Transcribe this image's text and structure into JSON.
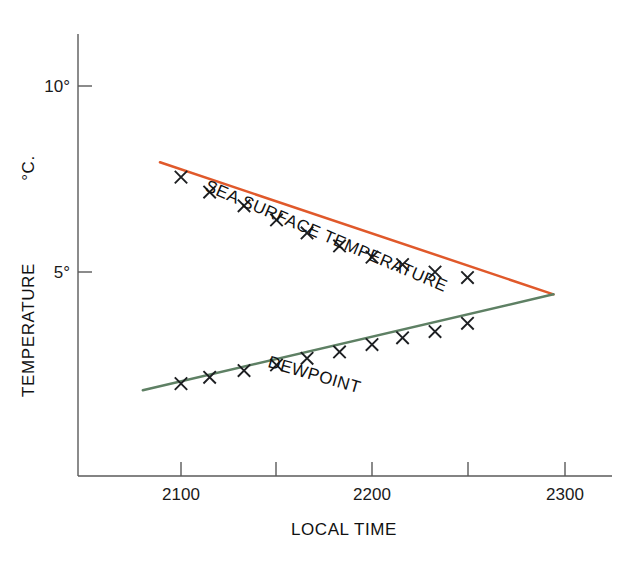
{
  "chart_data": {
    "type": "line",
    "title": "",
    "xlabel": "LOCAL TIME",
    "ylabel": "TEMPERATURE  °C.",
    "xlim": [
      2080,
      2312
    ],
    "ylim": [
      1.2,
      11.5
    ],
    "grid": false,
    "legend_position": "inline-annotation",
    "x_major_ticks": [
      2100,
      2200,
      2300
    ],
    "x_major_tick_labels": [
      "2100",
      "2200",
      "2300"
    ],
    "x_minor_ticks": [
      2150,
      2250
    ],
    "y_ticks": [
      5,
      10
    ],
    "y_tick_labels": [
      "5°",
      "10°"
    ],
    "units": "degrees Celsius",
    "annotations": [
      {
        "text": "SEA SURFACE TEMPERATURE",
        "rotation": 23,
        "x": 2112,
        "y": 7.2
      },
      {
        "text": "DEWPOINT",
        "rotation": 16,
        "x": 2145,
        "y": 2.45
      }
    ],
    "series": [
      {
        "name": "SEA SURFACE TEMPERATURE",
        "color": "#e0592b",
        "marker": "x",
        "x": [
          2100,
          2115,
          2133,
          2150,
          2166,
          2183,
          2200,
          2216,
          2233,
          2250
        ],
        "values": [
          7.55,
          7.15,
          6.78,
          6.4,
          6.05,
          5.7,
          5.4,
          5.2,
          5.0,
          4.85
        ],
        "line_x": [
          2089,
          2295
        ],
        "line_values": [
          7.95,
          4.4
        ]
      },
      {
        "name": "DEWPOINT",
        "color": "#5e8064",
        "marker": "x",
        "x": [
          2100,
          2115,
          2133,
          2150,
          2166,
          2183,
          2200,
          2216,
          2233,
          2250
        ],
        "values": [
          2.0,
          2.17,
          2.35,
          2.5,
          2.68,
          2.85,
          3.05,
          3.23,
          3.4,
          3.62
        ],
        "line_x": [
          2080,
          2295
        ],
        "line_values": [
          1.82,
          4.4
        ]
      }
    ]
  },
  "axes": {
    "y_title": "TEMPERATURE",
    "y_unit": "°C.",
    "x_title": "LOCAL TIME",
    "y_tick_10": "10°",
    "y_tick_5": "5°",
    "x_tick_2100": "2100",
    "x_tick_2200": "2200",
    "x_tick_2300": "2300"
  },
  "labels": {
    "sst": "SEA SURFACE TEMPERATURE",
    "dewpoint": "DEWPOINT"
  },
  "colors": {
    "sst_line": "#e0592b",
    "dewpoint_line": "#5e8064",
    "axis": "#5a5a5a",
    "text": "#111111",
    "background": "#ffffff"
  }
}
